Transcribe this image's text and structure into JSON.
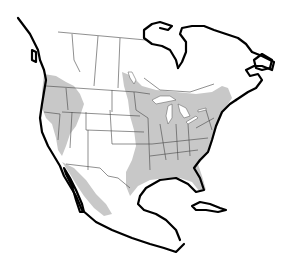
{
  "map": {
    "subject": "North America range map",
    "colors": {
      "background": "#ffffff",
      "range_fill": "#c8c8c8",
      "coastline": "#000000",
      "borders": "#444444"
    },
    "regions": [
      {
        "name": "range-pacific-northwest",
        "description": "Shaded range: Washington, Oregon, Idaho, western Montana"
      },
      {
        "name": "range-california",
        "description": "Shaded range: California coast and Sierra"
      },
      {
        "name": "range-baja-western-mexico",
        "description": "Shaded range: Baja and western Mexico coast"
      },
      {
        "name": "range-eastern-north-america",
        "description": "Shaded range: eastern US and southern Canada, west to Texas/Great Plains"
      }
    ]
  }
}
